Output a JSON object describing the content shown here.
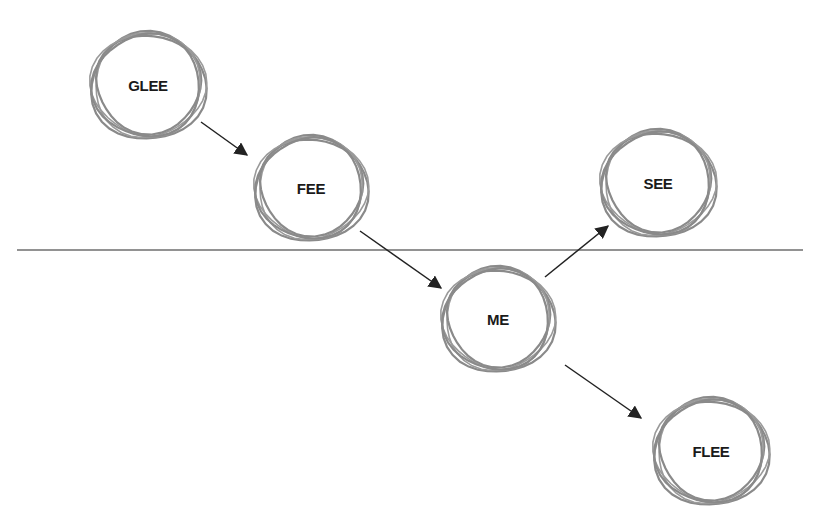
{
  "diagram": {
    "title": "",
    "colors": {
      "background": "#ffffff",
      "ring": "#8a8a8a",
      "arrow": "#222222",
      "divider": "#6e6e6e",
      "label": "#1a1a1a"
    },
    "divider": {
      "y": 250,
      "x1": 17,
      "x2": 803
    },
    "nodes": [
      {
        "id": "glee",
        "label": "GLEE",
        "cx": 148,
        "cy": 85,
        "r": 56
      },
      {
        "id": "fee",
        "label": "FEE",
        "cx": 311,
        "cy": 188,
        "r": 55
      },
      {
        "id": "me",
        "label": "ME",
        "cx": 498,
        "cy": 319,
        "r": 55
      },
      {
        "id": "see",
        "label": "SEE",
        "cx": 658,
        "cy": 183,
        "r": 56
      },
      {
        "id": "flee",
        "label": "FLEE",
        "cx": 711,
        "cy": 451,
        "r": 56
      }
    ],
    "edges": [
      {
        "from": "glee",
        "to": "fee",
        "x1": 201,
        "y1": 122,
        "x2": 247,
        "y2": 155
      },
      {
        "from": "fee",
        "to": "me",
        "x1": 360,
        "y1": 231,
        "x2": 441,
        "y2": 288
      },
      {
        "from": "me",
        "to": "see",
        "x1": 545,
        "y1": 277,
        "x2": 608,
        "y2": 226
      },
      {
        "from": "me",
        "to": "flee",
        "x1": 565,
        "y1": 365,
        "x2": 641,
        "y2": 418
      }
    ]
  }
}
